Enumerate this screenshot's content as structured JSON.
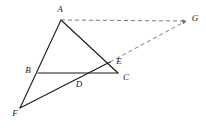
{
  "figure": {
    "canvas": {
      "width": 206,
      "height": 128,
      "background": "#ffffff"
    },
    "stroke_color": "#1a1a1a",
    "dash_color": "#6e6e6e",
    "solid_stroke_width": 1.1,
    "dash_stroke_width": 0.9,
    "dash_pattern": "4,3"
  },
  "points": {
    "A": {
      "label": "A",
      "x": 61,
      "y": 20,
      "label_x": 60,
      "label_y": 10
    },
    "B": {
      "label": "B",
      "x": 38,
      "y": 73,
      "label_x": 28,
      "label_y": 71
    },
    "C": {
      "label": "C",
      "x": 118,
      "y": 73,
      "label_x": 126,
      "label_y": 78
    },
    "D": {
      "label": "D",
      "x": 78,
      "y": 75,
      "label_x": 79,
      "label_y": 85
    },
    "E": {
      "label": "E",
      "x": 110,
      "y": 62,
      "label_x": 119,
      "label_y": 62
    },
    "F": {
      "label": "F",
      "x": 20,
      "y": 108,
      "label_x": 15,
      "label_y": 114
    },
    "G": {
      "label": "G",
      "x": 186,
      "y": 21,
      "label_x": 195,
      "label_y": 19
    }
  },
  "segments": {
    "solid": [
      {
        "name": "segment-A-F",
        "from": "A",
        "to": "F",
        "style": "solid"
      },
      {
        "name": "segment-A-C",
        "from": "A",
        "to": "C",
        "style": "solid"
      },
      {
        "name": "segment-B-C",
        "from": "B",
        "to": "C",
        "style": "solid"
      },
      {
        "name": "segment-F-E",
        "from": "F",
        "to": "E",
        "style": "solid"
      }
    ],
    "dashed": [
      {
        "name": "segment-A-G",
        "from": "A",
        "to": "G",
        "style": "dashed",
        "arrow": true
      },
      {
        "name": "segment-E-G",
        "from": "E",
        "to": "G",
        "style": "dashed",
        "arrow": true
      }
    ]
  },
  "labels_order": [
    "A",
    "G",
    "E",
    "B",
    "D",
    "C",
    "F"
  ]
}
